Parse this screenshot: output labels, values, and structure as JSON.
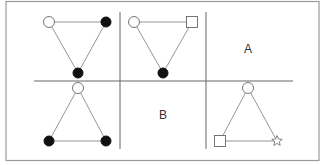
{
  "diagram": {
    "title": "",
    "frame": {
      "x": 6,
      "y": 1.5,
      "width": 313,
      "height": 159,
      "stroke": "#9a9a9a"
    },
    "grid": {
      "horizontal": {
        "y": 81,
        "x1": 34,
        "x2": 293,
        "stroke": "#666666"
      },
      "vertical": [
        {
          "x": 120,
          "y1": 12,
          "y2": 149,
          "stroke": "#666666"
        },
        {
          "x": 206,
          "y1": 12,
          "y2": 149,
          "stroke": "#666666"
        }
      ]
    },
    "panels": [
      {
        "id": "top-left",
        "nodes": [
          {
            "shape": "open-circle",
            "x": 49,
            "y": 22
          },
          {
            "shape": "filled-circle",
            "x": 106,
            "y": 22
          },
          {
            "shape": "filled-circle",
            "x": 78,
            "y": 73
          }
        ],
        "edges": [
          [
            0,
            1
          ],
          [
            0,
            2
          ],
          [
            1,
            2
          ]
        ]
      },
      {
        "id": "top-middle",
        "nodes": [
          {
            "shape": "open-circle",
            "x": 134,
            "y": 22
          },
          {
            "shape": "open-square",
            "x": 192,
            "y": 22
          },
          {
            "shape": "filled-circle",
            "x": 163,
            "y": 73
          }
        ],
        "edges": [
          [
            0,
            1
          ],
          [
            0,
            2
          ],
          [
            1,
            2
          ]
        ]
      },
      {
        "id": "top-right",
        "label": "A",
        "label_pos": {
          "x": 248,
          "y": 53
        }
      },
      {
        "id": "bottom-left",
        "nodes": [
          {
            "shape": "open-circle",
            "x": 78,
            "y": 88
          },
          {
            "shape": "filled-circle",
            "x": 49,
            "y": 141
          },
          {
            "shape": "filled-circle",
            "x": 106,
            "y": 141
          }
        ],
        "edges": [
          [
            0,
            1
          ],
          [
            0,
            2
          ],
          [
            1,
            2
          ]
        ]
      },
      {
        "id": "bottom-middle",
        "label": "B",
        "label_pos": {
          "x": 163,
          "y": 119
        }
      },
      {
        "id": "bottom-right",
        "nodes": [
          {
            "shape": "open-circle",
            "x": 248,
            "y": 88
          },
          {
            "shape": "open-square",
            "x": 220,
            "y": 141
          },
          {
            "shape": "open-star",
            "x": 277,
            "y": 141
          }
        ],
        "edges": [
          [
            0,
            1
          ],
          [
            0,
            2
          ],
          [
            1,
            2
          ]
        ]
      }
    ],
    "colors": {
      "edge": "#8a8a8a",
      "node_stroke": "#666666",
      "node_fill_filled": "#111111",
      "node_fill_open": "#ffffff",
      "text": "#333333"
    }
  }
}
